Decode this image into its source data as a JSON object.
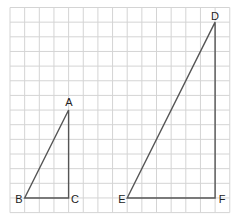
{
  "diagram": {
    "type": "similar-right-triangles-on-grid",
    "grid": {
      "cols": 15,
      "rows": 14,
      "cell_px": 14.65,
      "origin_x": 10,
      "origin_y": 7.5,
      "line_color": "#d4d4d4"
    },
    "triangles": [
      {
        "name": "ABC",
        "vertices": {
          "A": {
            "gx": 4,
            "gy": 7,
            "label": "A"
          },
          "B": {
            "gx": 1,
            "gy": 13,
            "label": "B"
          },
          "C": {
            "gx": 4,
            "gy": 13,
            "label": "C"
          }
        }
      },
      {
        "name": "DEF",
        "vertices": {
          "D": {
            "gx": 14,
            "gy": 1,
            "label": "D"
          },
          "E": {
            "gx": 8,
            "gy": 13,
            "label": "E"
          },
          "F": {
            "gx": 14,
            "gy": 13,
            "label": "F"
          }
        }
      }
    ],
    "stroke_color": "#555555"
  }
}
